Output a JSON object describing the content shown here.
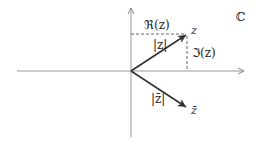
{
  "diagram": {
    "plane_label": "ℂ",
    "labels": {
      "z": "z",
      "z_conjugate": "z̄",
      "modulus_z": "|z|",
      "modulus_z_conjugate": "|z̄|",
      "real_part": "ℜ(z)",
      "imaginary_part": "ℑ(z)"
    },
    "colors": {
      "axis": "#999999",
      "vector": "#333333",
      "dashed": "#555555",
      "text": "#222222"
    }
  }
}
